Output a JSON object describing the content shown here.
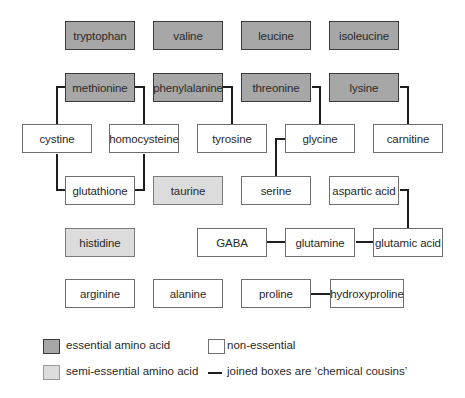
{
  "colors": {
    "essential": "#a7a7a7",
    "semi_essential": "#dcdcdc",
    "non_essential": "#ffffff",
    "connector": "#1e1e1e"
  },
  "boxes": {
    "tryptophan": {
      "label": "tryptophan",
      "type": "essential"
    },
    "valine": {
      "label": "valine",
      "type": "essential"
    },
    "leucine": {
      "label": "leucine",
      "type": "essential"
    },
    "isoleucine": {
      "label": "isoleucine",
      "type": "essential"
    },
    "methionine": {
      "label": "methionine",
      "type": "essential"
    },
    "phenylalanine": {
      "label": "phenylalanine",
      "type": "essential"
    },
    "threonine": {
      "label": "threonine",
      "type": "essential"
    },
    "lysine": {
      "label": "lysine",
      "type": "essential"
    },
    "cystine": {
      "label": "cystine",
      "type": "non-essential"
    },
    "homocysteine": {
      "label": "homocysteine",
      "type": "non-essential"
    },
    "tyrosine": {
      "label": "tyrosine",
      "type": "non-essential"
    },
    "glycine": {
      "label": "glycine",
      "type": "non-essential"
    },
    "carnitine": {
      "label": "carnitine",
      "type": "non-essential"
    },
    "glutathione": {
      "label": "glutathione",
      "type": "non-essential"
    },
    "taurine": {
      "label": "taurine",
      "type": "semi-essential"
    },
    "serine": {
      "label": "serine",
      "type": "non-essential"
    },
    "aspartic_acid": {
      "label": "aspartic acid",
      "type": "non-essential"
    },
    "histidine": {
      "label": "histidine",
      "type": "semi-essential"
    },
    "gaba": {
      "label": "GABA",
      "type": "non-essential"
    },
    "glutamine": {
      "label": "glutamine",
      "type": "non-essential"
    },
    "glutamic_acid": {
      "label": "glutamic acid",
      "type": "non-essential"
    },
    "arginine": {
      "label": "arginine",
      "type": "non-essential"
    },
    "alanine": {
      "label": "alanine",
      "type": "non-essential"
    },
    "proline": {
      "label": "proline",
      "type": "non-essential"
    },
    "hydroxyproline": {
      "label": "hydroxyproline",
      "type": "non-essential"
    }
  },
  "connections": [
    [
      "methionine",
      "cystine"
    ],
    [
      "methionine",
      "homocysteine"
    ],
    [
      "cystine",
      "glutathione"
    ],
    [
      "homocysteine",
      "glutathione"
    ],
    [
      "phenylalanine",
      "tyrosine"
    ],
    [
      "threonine",
      "glycine"
    ],
    [
      "lysine",
      "carnitine"
    ],
    [
      "glycine",
      "serine"
    ],
    [
      "tyrosine",
      "glycine"
    ],
    [
      "aspartic_acid",
      "glutamic_acid"
    ],
    [
      "gaba",
      "glutamine"
    ],
    [
      "glutamine",
      "glutamic_acid"
    ],
    [
      "proline",
      "hydroxyproline"
    ]
  ],
  "legend": {
    "essential": "essential amino acid",
    "semi_essential": "semi-essential amino acid",
    "non_essential": "non-essential",
    "connector": "joined boxes are ‘chemical cousins’"
  }
}
